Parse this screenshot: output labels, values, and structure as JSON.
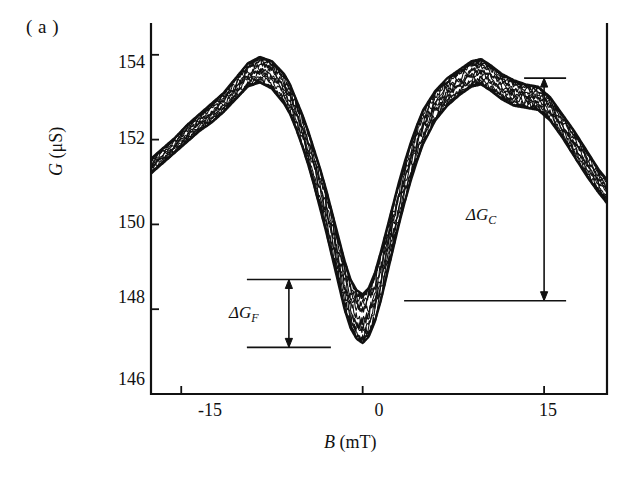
{
  "figure": {
    "panel_label": "( a )",
    "axes": {
      "xlabel_symbol": "B",
      "xlabel_unit": "(mT)",
      "ylabel_symbol": "G",
      "ylabel_unit": "(μS)",
      "xticks": [
        "-15",
        "0",
        "15"
      ],
      "yticks": [
        "154",
        "152",
        "150",
        "148",
        "146"
      ]
    },
    "annotations": {
      "delta_gc": "ΔG",
      "delta_gc_sub": "C",
      "delta_gf": "ΔG",
      "delta_gf_sub": "F"
    },
    "colors": {
      "ink": "#111111",
      "background": "#ffffff"
    }
  },
  "chart_data": {
    "type": "line",
    "title": "",
    "subtitle": "",
    "xlabel": "B (mT)",
    "ylabel": "G (μS)",
    "xlim": [
      -17.5,
      20.2
    ],
    "ylim": [
      146.0,
      154.75
    ],
    "xticks": [
      -15,
      0,
      15
    ],
    "yticks": [
      154,
      152,
      150,
      148,
      146
    ],
    "grid": false,
    "legend": null,
    "annotations": [
      {
        "label": "ΔG_C",
        "type": "double-arrow-vertical",
        "x": 15.0,
        "y_top": 153.45,
        "y_bottom": 148.2,
        "value": 5.25,
        "text_x": 11.2,
        "text_y": 150.3
      },
      {
        "label": "ΔG_F",
        "type": "double-arrow-vertical",
        "x": -6.1,
        "y_top": 148.7,
        "y_bottom": 147.1,
        "value": 1.6,
        "text_x": -9.1,
        "text_y": 147.95
      }
    ],
    "series": [
      {
        "name": "upper-envelope",
        "comment": "outer/upper boundary of the trace bundle",
        "x": [
          -17.5,
          -16.5,
          -15.5,
          -14.5,
          -13.5,
          -12.5,
          -11.5,
          -10.5,
          -9.5,
          -8.5,
          -7.5,
          -6.5,
          -6.0,
          -5.5,
          -5.0,
          -4.5,
          -4.0,
          -3.5,
          -3.0,
          -2.5,
          -2.0,
          -1.5,
          -1.0,
          -0.5,
          0.0,
          0.5,
          1.0,
          1.5,
          2.0,
          2.5,
          3.0,
          3.5,
          4.0,
          4.5,
          5.0,
          6.0,
          7.0,
          8.0,
          9.0,
          9.8,
          10.6,
          11.5,
          12.5,
          13.5,
          14.5,
          15.5,
          16.5,
          17.5,
          18.5,
          19.5,
          20.2
        ],
        "y": [
          151.55,
          151.8,
          152.05,
          152.35,
          152.6,
          152.85,
          153.1,
          153.45,
          153.8,
          153.95,
          153.85,
          153.55,
          153.3,
          152.95,
          152.6,
          152.2,
          151.75,
          151.3,
          150.8,
          150.25,
          149.7,
          149.15,
          148.7,
          148.45,
          148.35,
          148.5,
          148.85,
          149.35,
          149.9,
          150.45,
          151.0,
          151.5,
          151.95,
          152.35,
          152.7,
          153.15,
          153.45,
          153.65,
          153.85,
          153.9,
          153.75,
          153.55,
          153.4,
          153.3,
          153.25,
          153.0,
          152.6,
          152.2,
          151.75,
          151.3,
          151.05
        ]
      },
      {
        "name": "lower-envelope",
        "comment": "inner/lower boundary of the trace bundle",
        "x": [
          -17.5,
          -16.5,
          -15.5,
          -14.5,
          -13.5,
          -12.5,
          -11.5,
          -10.5,
          -9.5,
          -8.5,
          -7.5,
          -6.5,
          -6.0,
          -5.5,
          -5.0,
          -4.5,
          -4.0,
          -3.5,
          -3.0,
          -2.5,
          -2.0,
          -1.5,
          -1.0,
          -0.5,
          0.0,
          0.5,
          1.0,
          1.5,
          2.0,
          2.5,
          3.0,
          3.5,
          4.0,
          4.5,
          5.0,
          6.0,
          7.0,
          8.0,
          9.0,
          9.8,
          10.6,
          11.5,
          12.5,
          13.5,
          14.5,
          15.5,
          16.5,
          17.5,
          18.5,
          19.5,
          20.2
        ],
        "y": [
          151.2,
          151.45,
          151.7,
          151.95,
          152.2,
          152.4,
          152.65,
          152.95,
          153.25,
          153.35,
          153.2,
          152.85,
          152.6,
          152.25,
          151.85,
          151.4,
          150.9,
          150.35,
          149.8,
          149.2,
          148.6,
          148.0,
          147.55,
          147.3,
          147.2,
          147.35,
          147.7,
          148.2,
          148.8,
          149.4,
          150.0,
          150.55,
          151.05,
          151.5,
          151.9,
          152.45,
          152.8,
          153.05,
          153.25,
          153.3,
          153.15,
          152.95,
          152.8,
          152.75,
          152.7,
          152.45,
          152.05,
          151.6,
          151.15,
          150.75,
          150.5
        ]
      },
      {
        "name": "mid-trace",
        "comment": "representative noisy trace running through the bundle",
        "x": [
          -17.5,
          -16.5,
          -15.5,
          -14.5,
          -13.5,
          -12.5,
          -11.5,
          -10.5,
          -9.5,
          -8.5,
          -7.5,
          -6.5,
          -6.0,
          -5.5,
          -5.0,
          -4.5,
          -4.0,
          -3.5,
          -3.0,
          -2.5,
          -2.0,
          -1.5,
          -1.0,
          -0.5,
          0.0,
          0.5,
          1.0,
          1.5,
          2.0,
          2.5,
          3.0,
          3.5,
          4.0,
          4.5,
          5.0,
          6.0,
          7.0,
          8.0,
          9.0,
          9.8,
          10.6,
          11.5,
          12.5,
          13.5,
          14.5,
          15.5,
          16.5,
          17.5,
          18.5,
          19.5,
          20.2
        ],
        "y": [
          151.38,
          151.62,
          151.88,
          152.15,
          152.4,
          152.62,
          152.88,
          153.2,
          153.52,
          153.65,
          153.52,
          153.2,
          152.95,
          152.6,
          152.22,
          151.8,
          151.32,
          150.82,
          150.3,
          149.72,
          149.15,
          148.58,
          148.12,
          147.88,
          147.78,
          147.92,
          148.28,
          148.78,
          149.35,
          149.92,
          150.5,
          151.02,
          151.5,
          151.92,
          152.3,
          152.8,
          153.12,
          153.35,
          153.55,
          153.6,
          153.45,
          153.25,
          153.1,
          153.02,
          152.98,
          152.72,
          152.32,
          151.9,
          151.45,
          151.02,
          150.78
        ]
      }
    ],
    "key_features": {
      "central_minimum_B": 0.0,
      "central_minimum_G": 147.2,
      "left_peak_B": -8.5,
      "left_peak_G": 153.95,
      "right_peak_B": 9.8,
      "right_peak_G": 153.9
    }
  }
}
